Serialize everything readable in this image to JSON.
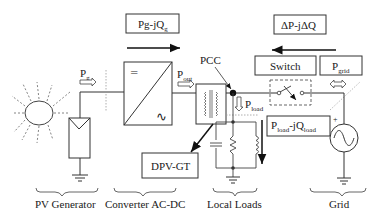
{
  "diagram": {
    "boxes": {
      "pg_jqg": {
        "main": "Pg-jQ",
        "sub": "g"
      },
      "dp_jdq": {
        "main": "ΔP-jΔQ"
      },
      "switch": {
        "main": "Switch"
      },
      "pgrid": {
        "main": "P",
        "sub": "grid"
      },
      "dpv_gt": {
        "main": "DPV-GT"
      },
      "pload_jqload": {
        "main1": "P",
        "sub1": "load",
        "mid": "-jQ",
        "sub2": "load"
      }
    },
    "flow_labels": {
      "pg": {
        "main": "P",
        "sub": "g"
      },
      "pout": {
        "main": "P",
        "sub": "out"
      },
      "pload": {
        "main": "P",
        "sub": "load"
      },
      "pcc": "PCC"
    },
    "converter_symbols": {
      "dc": "═",
      "ac": "∿"
    },
    "section_labels": [
      "PV Generator",
      "Converter AC-DC",
      "Local Loads",
      "Grid"
    ],
    "grid_source_polarity": "+",
    "colors": {
      "line": "#2a2a2a",
      "box_border": "#333333",
      "dashed_rays": "#777777",
      "background": "#ffffff"
    }
  }
}
